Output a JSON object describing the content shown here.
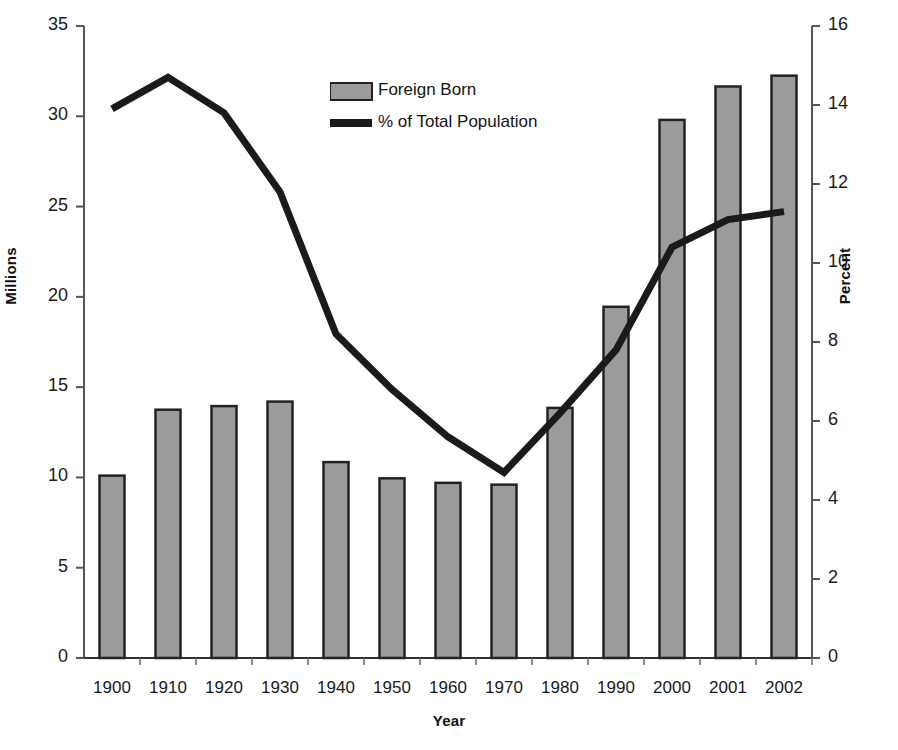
{
  "chart_data": {
    "type": "bar",
    "title": "",
    "subtitle": "",
    "xlabel": "Year",
    "ylabel": "Millions",
    "y2label": "Percent",
    "categories": [
      "1900",
      "1910",
      "1920",
      "1930",
      "1940",
      "1950",
      "1960",
      "1970",
      "1980",
      "1990",
      "2000",
      "2001",
      "2002"
    ],
    "ylim": [
      0,
      35
    ],
    "y2lim": [
      0,
      16
    ],
    "yticks": [
      "0",
      "5",
      "10",
      "15",
      "20",
      "25",
      "30",
      "35"
    ],
    "y2ticks": [
      "0",
      "2",
      "4",
      "6",
      "8",
      "10",
      "12",
      "14",
      "16"
    ],
    "grid": false,
    "legend_position": "upper-center",
    "series": [
      {
        "name": "Foreign Born",
        "type": "bar",
        "axis": "left",
        "unit": "Millions",
        "color": "#9b9b9b",
        "edge_color": "#222222",
        "values": [
          10.1,
          13.75,
          13.95,
          14.2,
          10.85,
          9.95,
          9.7,
          9.6,
          13.85,
          19.45,
          29.8,
          31.65,
          32.25
        ]
      },
      {
        "name": "% of Total Population",
        "type": "line",
        "axis": "right",
        "unit": "Percent",
        "color": "#1a1a1a",
        "values": [
          13.9,
          14.7,
          13.8,
          11.8,
          8.2,
          6.8,
          5.6,
          4.7,
          6.2,
          7.8,
          10.4,
          11.1,
          11.3
        ]
      }
    ],
    "legend": [
      {
        "label": "Foreign Born",
        "marker": "swatch",
        "color": "#9b9b9b"
      },
      {
        "label": "% of Total Population",
        "marker": "line",
        "color": "#1a1a1a"
      }
    ]
  },
  "axes": {
    "left_title": "Millions",
    "right_title": "Percent",
    "x_title": "Year"
  }
}
